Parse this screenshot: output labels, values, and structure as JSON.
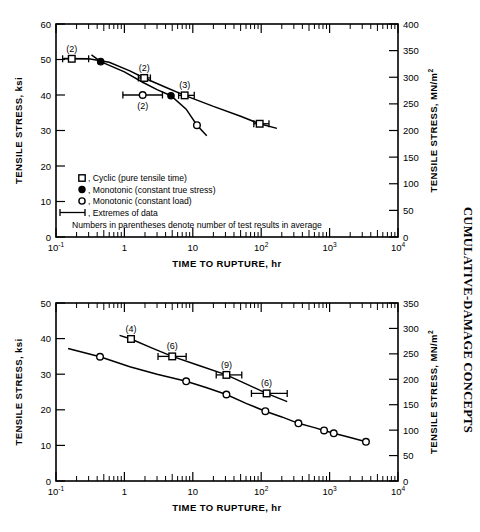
{
  "side_caption": "CUMULATIVE-DAMAGE CONCEPTS",
  "axis_titles": {
    "x": "TIME TO RUPTURE, hr",
    "y_left": "TENSILE STRESS, ksi",
    "y_right": "TENSILE STRESS, MN/m",
    "y_right_sup": "2"
  },
  "x_ticks": [
    {
      "label": "10",
      "sup": "-1",
      "value": 0.1
    },
    {
      "label": "1",
      "sup": "",
      "value": 1
    },
    {
      "label": "10",
      "sup": "",
      "value": 10
    },
    {
      "label": "10",
      "sup": "2",
      "value": 100
    },
    {
      "label": "10",
      "sup": "3",
      "value": 1000
    },
    {
      "label": "10",
      "sup": "4",
      "value": 10000
    }
  ],
  "legend": {
    "items": [
      {
        "marker": "open-square",
        "text": ", Cyclic (pure tensile time)"
      },
      {
        "marker": "filled-circle",
        "text": ", Monotonic (constant true stress)"
      },
      {
        "marker": "open-circle",
        "text": ", Monotonic (constant load)"
      },
      {
        "marker": "error-bar",
        "text": ", Extremes of data"
      }
    ],
    "note": "Numbers in parentheses denote number of test results in average"
  },
  "chart_data": [
    {
      "type": "scatter",
      "id": "top",
      "title": "",
      "xlabel": "TIME TO RUPTURE, hr",
      "ylabel": "TENSILE STRESS, ksi",
      "ylabel_right": "TENSILE STRESS, MN/m2",
      "xscale": "log",
      "xlim": [
        0.1,
        10000
      ],
      "ylim": [
        0,
        60
      ],
      "ylim_right": [
        0,
        400
      ],
      "y_ticks": [
        0,
        10,
        20,
        30,
        40,
        50,
        60
      ],
      "y_ticks_right": [
        0,
        50,
        100,
        150,
        200,
        250,
        300,
        350,
        400
      ],
      "grid": false,
      "legend_position": "lower-left-inside",
      "series": [
        {
          "name": "Cyclic (pure tensile time)",
          "marker": "open-square",
          "points": [
            {
              "x": 0.17,
              "y": 50.2,
              "label": "(2)",
              "label_pos": "above",
              "err_lo": 0.125,
              "err_hi": 0.3
            },
            {
              "x": 1.95,
              "y": 44.8,
              "label": "(2)",
              "label_pos": "above",
              "err_lo": 1.6,
              "err_hi": 2.4
            },
            {
              "x": 7.6,
              "y": 39.9,
              "label": "(3)",
              "label_pos": "above",
              "err_lo": 6.2,
              "err_hi": 10.5
            },
            {
              "x": 95,
              "y": 31.9,
              "label": "",
              "label_pos": "above",
              "err_lo": 78,
              "err_hi": 130
            }
          ]
        },
        {
          "name": "Monotonic (constant true stress)",
          "marker": "filled-circle",
          "points": [
            {
              "x": 0.45,
              "y": 49.4,
              "label": "",
              "label_pos": "above"
            },
            {
              "x": 4.8,
              "y": 39.8,
              "label": "",
              "label_pos": "above"
            }
          ]
        },
        {
          "name": "Monotonic (constant load)",
          "marker": "open-circle",
          "points": [
            {
              "x": 1.85,
              "y": 40.0,
              "label": "(2)",
              "label_pos": "below",
              "err_lo": 0.95,
              "err_hi": 3.6
            },
            {
              "x": 11.5,
              "y": 31.5,
              "label": "",
              "label_pos": "below"
            }
          ]
        }
      ],
      "curves": [
        {
          "name": "cyclic-curve",
          "points": [
            [
              0.13,
              50.3
            ],
            [
              0.3,
              50.2
            ],
            [
              0.6,
              49.2
            ],
            [
              1.2,
              46.8
            ],
            [
              1.95,
              44.8
            ],
            [
              4.0,
              42.2
            ],
            [
              7.6,
              39.9
            ],
            [
              20,
              36.8
            ],
            [
              50,
              34.0
            ],
            [
              95,
              31.9
            ],
            [
              170,
              30.6
            ]
          ]
        },
        {
          "name": "monotonic-curve",
          "points": [
            [
              0.33,
              51.3
            ],
            [
              0.45,
              49.4
            ],
            [
              1.0,
              46.5
            ],
            [
              1.85,
              43.6
            ],
            [
              3.0,
              41.5
            ],
            [
              4.8,
              39.8
            ],
            [
              8.0,
              36.0
            ],
            [
              11.5,
              31.5
            ],
            [
              16,
              28.5
            ]
          ]
        }
      ]
    },
    {
      "type": "scatter",
      "id": "bottom",
      "title": "",
      "xlabel": "TIME TO RUPTURE, hr",
      "ylabel": "TENSILE STRESS, ksi",
      "ylabel_right": "TENSILE STRESS, MN/m2",
      "xscale": "log",
      "xlim": [
        0.1,
        10000
      ],
      "ylim": [
        0,
        50
      ],
      "ylim_right": [
        0,
        350
      ],
      "y_ticks": [
        0,
        10,
        20,
        30,
        40,
        50
      ],
      "y_ticks_right": [
        0,
        50,
        100,
        150,
        200,
        250,
        300,
        350
      ],
      "grid": false,
      "legend_position": "none",
      "series": [
        {
          "name": "Cyclic (pure tensile time)",
          "marker": "open-square",
          "points": [
            {
              "x": 1.25,
              "y": 39.9,
              "label": "(4)",
              "label_pos": "above"
            },
            {
              "x": 5.0,
              "y": 35.0,
              "label": "(6)",
              "label_pos": "above",
              "err_lo": 3.1,
              "err_hi": 8.0
            },
            {
              "x": 31,
              "y": 29.8,
              "label": "(9)",
              "label_pos": "above",
              "err_lo": 22,
              "err_hi": 52
            },
            {
              "x": 120,
              "y": 24.6,
              "label": "(6)",
              "label_pos": "above",
              "err_lo": 72,
              "err_hi": 240
            }
          ]
        },
        {
          "name": "Monotonic (constant load)",
          "marker": "open-circle",
          "points": [
            {
              "x": 0.44,
              "y": 34.9,
              "label": ""
            },
            {
              "x": 8.0,
              "y": 28.0,
              "label": ""
            },
            {
              "x": 31,
              "y": 24.3,
              "label": ""
            },
            {
              "x": 115,
              "y": 19.6,
              "label": ""
            },
            {
              "x": 350,
              "y": 16.2,
              "label": ""
            },
            {
              "x": 830,
              "y": 14.2,
              "label": ""
            },
            {
              "x": 1150,
              "y": 13.4,
              "label": ""
            },
            {
              "x": 3400,
              "y": 11.0,
              "label": ""
            }
          ]
        }
      ],
      "curves": [
        {
          "name": "cyclic-curve",
          "points": [
            [
              0.85,
              40.9
            ],
            [
              1.25,
              39.9
            ],
            [
              2.5,
              37.4
            ],
            [
              5.0,
              35.0
            ],
            [
              12,
              32.5
            ],
            [
              31,
              29.8
            ],
            [
              60,
              27.3
            ],
            [
              120,
              24.6
            ],
            [
              240,
              22.3
            ]
          ]
        },
        {
          "name": "monotonic-curve",
          "points": [
            [
              0.15,
              37.2
            ],
            [
              0.44,
              34.9
            ],
            [
              1.2,
              32.1
            ],
            [
              3.0,
              30.0
            ],
            [
              8.0,
              28.0
            ],
            [
              16,
              26.2
            ],
            [
              31,
              24.3
            ],
            [
              60,
              21.8
            ],
            [
              115,
              19.6
            ],
            [
              200,
              18.0
            ],
            [
              350,
              16.2
            ],
            [
              600,
              15.0
            ],
            [
              830,
              14.2
            ],
            [
              1150,
              13.4
            ],
            [
              2000,
              12.2
            ],
            [
              3400,
              11.0
            ]
          ]
        }
      ]
    }
  ]
}
